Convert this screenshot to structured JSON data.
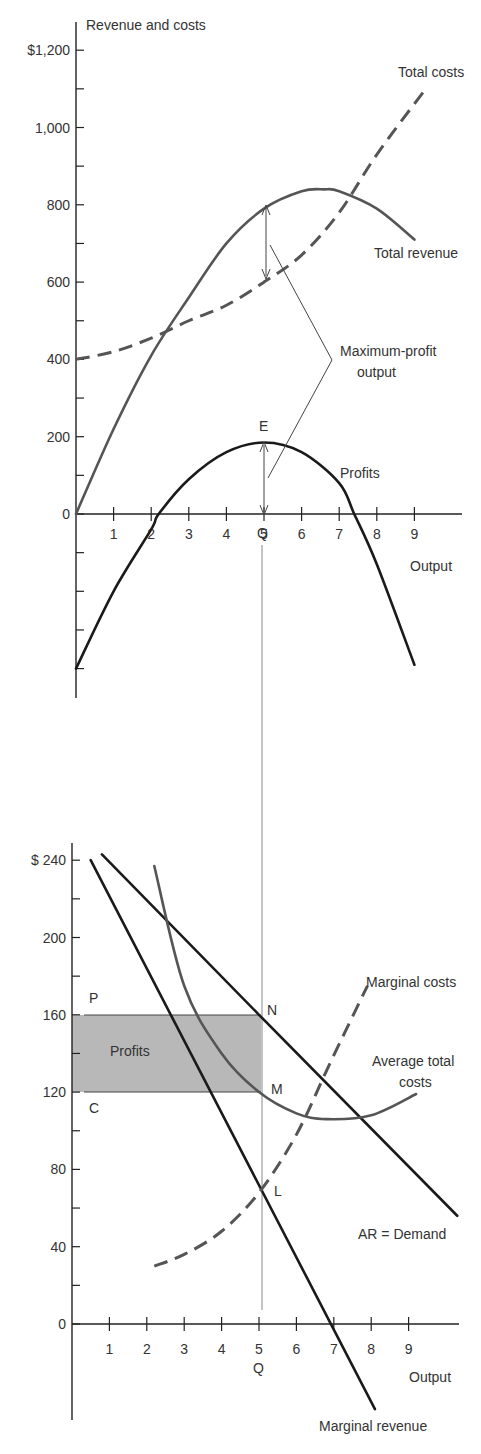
{
  "top_chart": {
    "y_axis_title": "Revenue and costs",
    "y_ticks": [
      {
        "value": 1200,
        "label": "$1,200"
      },
      {
        "value": 1000,
        "label": "1,000"
      },
      {
        "value": 800,
        "label": "800"
      },
      {
        "value": 600,
        "label": "600"
      },
      {
        "value": 400,
        "label": "400"
      },
      {
        "value": 200,
        "label": "200"
      },
      {
        "value": 0,
        "label": "0"
      }
    ],
    "x_ticks": [
      "1",
      "2",
      "3",
      "4",
      "5",
      "6",
      "7",
      "8",
      "9"
    ],
    "x_axis_title": "Output",
    "q_label": "Q",
    "e_label": "E",
    "labels": {
      "total_costs": "Total costs",
      "total_revenue": "Total revenue",
      "profits": "Profits",
      "max_profit_line1": "Maximum-profit",
      "max_profit_line2": "output"
    }
  },
  "bottom_chart": {
    "y_ticks": [
      {
        "value": 240,
        "label": "$ 240"
      },
      {
        "value": 200,
        "label": "200"
      },
      {
        "value": 160,
        "label": "160"
      },
      {
        "value": 120,
        "label": "120"
      },
      {
        "value": 80,
        "label": "80"
      },
      {
        "value": 40,
        "label": "40"
      },
      {
        "value": 0,
        "label": "0"
      }
    ],
    "x_ticks": [
      "1",
      "2",
      "3",
      "4",
      "5",
      "6",
      "7",
      "8",
      "9"
    ],
    "x_axis_title": "Output",
    "q_label": "Q",
    "point_labels": {
      "P": "P",
      "C": "C",
      "N": "N",
      "M": "M",
      "L": "L"
    },
    "labels": {
      "profits_box": "Profits",
      "marginal_costs": "Marginal costs",
      "atc_line1": "Average total",
      "atc_line2": "costs",
      "ar_demand": "AR = Demand",
      "marginal_revenue": "Marginal revenue"
    },
    "colors": {
      "profit_fill": "#b8b8b8"
    }
  },
  "chart_data": [
    {
      "type": "line",
      "title": "",
      "xlabel": "Output",
      "ylabel": "Revenue and costs",
      "xlim": [
        0,
        10
      ],
      "ylim": [
        -400,
        1200
      ],
      "grid": false,
      "series": [
        {
          "name": "Total costs",
          "style": "dashed",
          "x": [
            0,
            1,
            2,
            3,
            4,
            5,
            6,
            7,
            8,
            9.3
          ],
          "y": [
            400,
            420,
            455,
            500,
            540,
            600,
            670,
            780,
            930,
            1100
          ]
        },
        {
          "name": "Total revenue",
          "style": "solid",
          "x": [
            0,
            1,
            2,
            3,
            4,
            5,
            6,
            6.6,
            7,
            8,
            9
          ],
          "y": [
            0,
            220,
            410,
            560,
            700,
            790,
            835,
            840,
            835,
            790,
            710
          ]
        },
        {
          "name": "Profits",
          "style": "solid",
          "x": [
            0,
            1,
            2,
            2.2,
            3,
            4,
            5,
            6,
            7,
            7.4,
            8,
            9
          ],
          "y": [
            -400,
            -200,
            -40,
            0,
            90,
            160,
            185,
            160,
            80,
            0,
            -130,
            -390
          ]
        }
      ],
      "annotations": [
        {
          "text": "E",
          "x": 5,
          "y": 185
        },
        {
          "text": "Q",
          "x": 5,
          "y": -60
        },
        {
          "text": "Maximum-profit output",
          "x": 5
        }
      ]
    },
    {
      "type": "line",
      "title": "",
      "xlabel": "Output",
      "ylabel": "",
      "xlim": [
        0,
        10
      ],
      "ylim": [
        -60,
        240
      ],
      "grid": false,
      "series": [
        {
          "name": "AR = Demand",
          "style": "solid",
          "x": [
            0.8,
            5,
            10.3
          ],
          "y": [
            243,
            160,
            56
          ]
        },
        {
          "name": "Marginal revenue",
          "style": "solid",
          "x": [
            0.5,
            5,
            7,
            8.1
          ],
          "y": [
            240,
            68,
            0,
            -44
          ]
        },
        {
          "name": "Average total costs",
          "style": "solid",
          "x": [
            2.2,
            3,
            4,
            5,
            6,
            6.8,
            8,
            9.2
          ],
          "y": [
            237,
            175,
            140,
            120,
            109,
            106,
            108,
            119
          ]
        },
        {
          "name": "Marginal costs",
          "style": "dashed",
          "x": [
            2.2,
            3,
            4,
            5,
            6,
            6.9,
            7.9
          ],
          "y": [
            30,
            36,
            48,
            68,
            98,
            135,
            175
          ]
        }
      ],
      "shaded_region": {
        "name": "Profits",
        "x": [
          0,
          5
        ],
        "y": [
          120,
          160
        ]
      },
      "points": [
        {
          "label": "P",
          "x": 0,
          "y": 160
        },
        {
          "label": "C",
          "x": 0,
          "y": 120
        },
        {
          "label": "N",
          "x": 5,
          "y": 160
        },
        {
          "label": "M",
          "x": 5,
          "y": 120
        },
        {
          "label": "L",
          "x": 5,
          "y": 68
        }
      ],
      "annotations": [
        {
          "text": "Q",
          "x": 5
        }
      ]
    }
  ]
}
